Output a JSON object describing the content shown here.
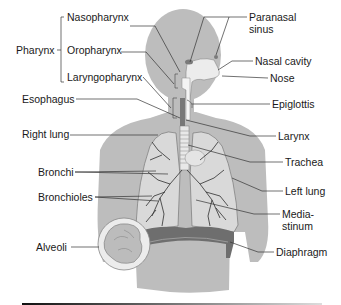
{
  "diagram": {
    "colors": {
      "background": "#ffffff",
      "body_silhouette": "#bdbdbd",
      "lung_fill": "#d9d9d9",
      "airway": "#f2f2f2",
      "diaphragm": "#6e6e6e",
      "leader_line": "#333333",
      "label_text": "#1a1a1a",
      "footer_bar": "#222222"
    },
    "group_labels": {
      "pharynx": "Pharynx"
    },
    "labels_left": [
      {
        "id": "nasopharynx",
        "text": "Nasopharynx"
      },
      {
        "id": "oropharynx",
        "text": "Oropharynx"
      },
      {
        "id": "laryngopharynx",
        "text": "Laryngopharynx"
      },
      {
        "id": "esophagus",
        "text": "Esophagus"
      },
      {
        "id": "right_lung",
        "text": "Right lung"
      },
      {
        "id": "bronchi",
        "text": "Bronchi"
      },
      {
        "id": "bronchioles",
        "text": "Bronchioles"
      },
      {
        "id": "alveoli",
        "text": "Alveoli"
      }
    ],
    "labels_right": [
      {
        "id": "paranasal_sinus",
        "line1": "Paranasal",
        "line2": "sinus"
      },
      {
        "id": "nasal_cavity",
        "text": "Nasal cavity"
      },
      {
        "id": "nose",
        "text": "Nose"
      },
      {
        "id": "epiglottis",
        "text": "Epiglottis"
      },
      {
        "id": "larynx",
        "text": "Larynx"
      },
      {
        "id": "trachea",
        "text": "Trachea"
      },
      {
        "id": "left_lung",
        "text": "Left lung"
      },
      {
        "id": "mediastinum",
        "line1": "Media-",
        "line2": "stinum"
      },
      {
        "id": "diaphragm",
        "text": "Diaphragm"
      }
    ]
  }
}
